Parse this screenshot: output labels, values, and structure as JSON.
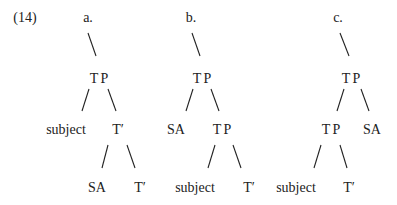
{
  "example_number": "(14)",
  "trees": [
    {
      "label": "a.",
      "root": "TP",
      "level1": [
        "subject",
        "T′"
      ],
      "level2": [
        "SA",
        "T′"
      ]
    },
    {
      "label": "b.",
      "root": "TP",
      "level1": [
        "SA",
        "TP"
      ],
      "level2": [
        "subject",
        "T′"
      ]
    },
    {
      "label": "c.",
      "root": "TP",
      "level1": [
        "TP",
        "SA"
      ],
      "level2": [
        "subject",
        "T′"
      ]
    }
  ]
}
